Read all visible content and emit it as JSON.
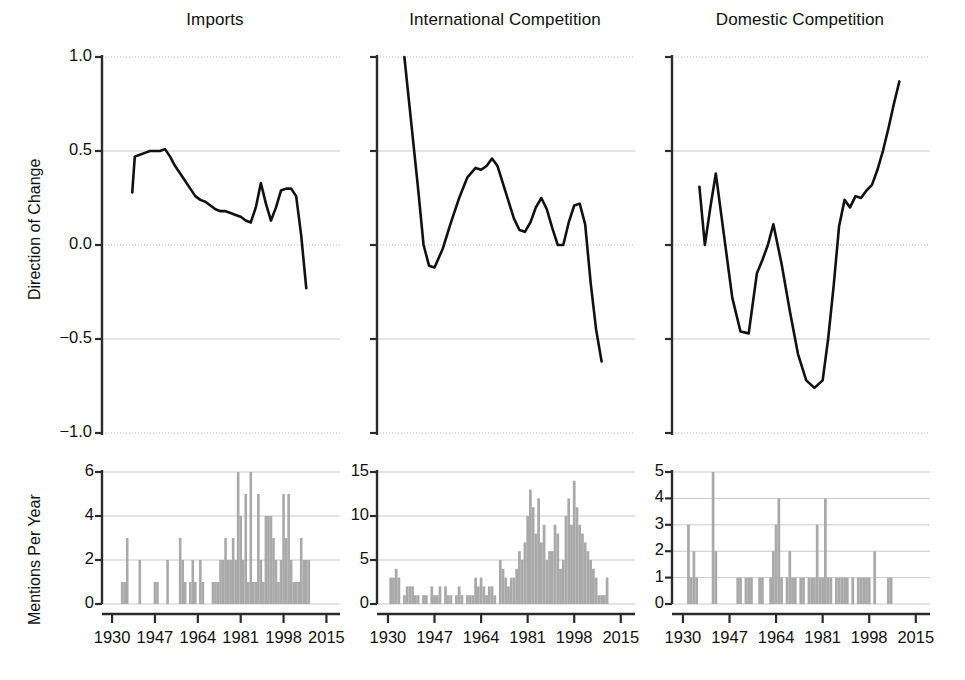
{
  "figure": {
    "width": 965,
    "height": 680,
    "background": "#ffffff",
    "line_color": "#111111",
    "bar_color": "#a9a9a9",
    "grid_color": "#c9c9c9"
  },
  "axis_titles": {
    "top_y": "Direction of Change",
    "bottom_y": "Mentions Per Year"
  },
  "panels": [
    {
      "key": "imports",
      "title": "Imports"
    },
    {
      "key": "international",
      "title": "International Competition"
    },
    {
      "key": "domestic",
      "title": "Domestic Competition"
    }
  ],
  "x_ticks": [
    "1930",
    "1947",
    "1964",
    "1981",
    "1998",
    "2015"
  ],
  "x_tick_values": [
    1930,
    1947,
    1964,
    1981,
    1998,
    2015
  ],
  "x_range": [
    1926,
    2018
  ],
  "y_ticks_top": [
    "1.0",
    "0.5",
    "0.0",
    "-0.5",
    "-1.0"
  ],
  "y_tick_values_top": [
    1.0,
    0.5,
    0.0,
    -0.5,
    -1.0
  ],
  "y_ticks_bottom": {
    "imports": [
      "0",
      "2",
      "4",
      "6"
    ],
    "international": [
      "0",
      "5",
      "10",
      "15"
    ],
    "domestic": [
      "0",
      "1",
      "2",
      "3",
      "4",
      "5"
    ]
  },
  "chart_data": [
    {
      "id": "imports-direction",
      "type": "line",
      "title": "Imports",
      "xlabel": "",
      "ylabel": "Direction of Change",
      "xlim": [
        1926,
        2018
      ],
      "ylim": [
        -1.0,
        1.0
      ],
      "grid": true,
      "legend": "none",
      "x": [
        1938,
        1939,
        1941,
        1943,
        1945,
        1947,
        1949,
        1951,
        1953,
        1955,
        1957,
        1959,
        1961,
        1963,
        1965,
        1967,
        1969,
        1971,
        1973,
        1975,
        1977,
        1979,
        1981,
        1983,
        1985,
        1987,
        1989,
        1991,
        1993,
        1995,
        1997,
        1999,
        2001,
        2003,
        2005,
        2007
      ],
      "y": [
        0.28,
        0.47,
        0.48,
        0.49,
        0.5,
        0.5,
        0.5,
        0.51,
        0.47,
        0.42,
        0.38,
        0.34,
        0.3,
        0.26,
        0.24,
        0.23,
        0.21,
        0.19,
        0.18,
        0.18,
        0.17,
        0.16,
        0.15,
        0.13,
        0.12,
        0.2,
        0.33,
        0.22,
        0.13,
        0.2,
        0.29,
        0.3,
        0.3,
        0.26,
        0.05,
        -0.23
      ]
    },
    {
      "id": "imports-mentions",
      "type": "bar",
      "title": "Imports",
      "xlabel": "",
      "ylabel": "Mentions Per Year",
      "xlim": [
        1926,
        2018
      ],
      "ylim": [
        0,
        6
      ],
      "grid": true,
      "legend": "none",
      "categories": [
        1934,
        1935,
        1936,
        1941,
        1947,
        1948,
        1952,
        1957,
        1958,
        1959,
        1961,
        1962,
        1963,
        1965,
        1966,
        1970,
        1971,
        1972,
        1973,
        1974,
        1975,
        1976,
        1977,
        1978,
        1979,
        1980,
        1981,
        1982,
        1983,
        1984,
        1985,
        1986,
        1987,
        1988,
        1989,
        1990,
        1991,
        1992,
        1993,
        1994,
        1995,
        1996,
        1997,
        1998,
        1999,
        2000,
        2001,
        2002,
        2003,
        2004,
        2005,
        2006,
        2007,
        2008
      ],
      "values": [
        1,
        1,
        3,
        2,
        1,
        1,
        2,
        3,
        2,
        1,
        1,
        2,
        1,
        2,
        1,
        1,
        1,
        1,
        2,
        2,
        3,
        2,
        2,
        3,
        2,
        6,
        4,
        2,
        5,
        1,
        6,
        1,
        1,
        5,
        2,
        1,
        4,
        4,
        4,
        3,
        2,
        1,
        2,
        5,
        3,
        5,
        2,
        1,
        1,
        1,
        3,
        2,
        2,
        2
      ]
    },
    {
      "id": "international-direction",
      "type": "line",
      "title": "International Competition",
      "xlabel": "",
      "ylabel": "Direction of Change",
      "xlim": [
        1926,
        2018
      ],
      "ylim": [
        -1.0,
        1.0
      ],
      "grid": true,
      "legend": "none",
      "x": [
        1936,
        1938,
        1941,
        1943,
        1945,
        1947,
        1950,
        1953,
        1956,
        1959,
        1962,
        1964,
        1966,
        1968,
        1970,
        1973,
        1976,
        1978,
        1980,
        1982,
        1984,
        1986,
        1988,
        1990,
        1992,
        1994,
        1996,
        1998,
        2000,
        2002,
        2004,
        2006,
        2008
      ],
      "y": [
        1.0,
        0.72,
        0.3,
        0.0,
        -0.11,
        -0.12,
        -0.02,
        0.12,
        0.25,
        0.36,
        0.41,
        0.4,
        0.42,
        0.46,
        0.42,
        0.28,
        0.14,
        0.08,
        0.07,
        0.12,
        0.2,
        0.25,
        0.19,
        0.09,
        0.0,
        0.0,
        0.12,
        0.21,
        0.22,
        0.11,
        -0.2,
        -0.45,
        -0.62
      ]
    },
    {
      "id": "international-mentions",
      "type": "bar",
      "title": "International Competition",
      "xlabel": "",
      "ylabel": "Mentions Per Year",
      "xlim": [
        1926,
        2018
      ],
      "ylim": [
        0,
        15
      ],
      "grid": true,
      "legend": "none",
      "categories": [
        1931,
        1932,
        1933,
        1934,
        1936,
        1937,
        1938,
        1939,
        1940,
        1941,
        1943,
        1944,
        1946,
        1947,
        1948,
        1949,
        1951,
        1952,
        1953,
        1955,
        1956,
        1957,
        1959,
        1960,
        1961,
        1962,
        1963,
        1964,
        1965,
        1966,
        1967,
        1968,
        1969,
        1971,
        1972,
        1973,
        1974,
        1975,
        1976,
        1977,
        1978,
        1979,
        1980,
        1981,
        1982,
        1983,
        1984,
        1985,
        1986,
        1987,
        1988,
        1989,
        1990,
        1991,
        1992,
        1993,
        1994,
        1995,
        1996,
        1997,
        1998,
        1999,
        2000,
        2001,
        2002,
        2003,
        2004,
        2005,
        2006,
        2007,
        2008,
        2009,
        2010
      ],
      "values": [
        3,
        3,
        4,
        3,
        1,
        2,
        2,
        2,
        1,
        1,
        1,
        1,
        2,
        1,
        1,
        2,
        2,
        1,
        1,
        1,
        2,
        1,
        1,
        1,
        1,
        3,
        2,
        3,
        2,
        1,
        2,
        2,
        1,
        5,
        4,
        3,
        2,
        3,
        3,
        4,
        6,
        5,
        7,
        10,
        13,
        11,
        8,
        12,
        7,
        9,
        5,
        6,
        6,
        9,
        8,
        4,
        5,
        10,
        12,
        9,
        14,
        11,
        9,
        8,
        7,
        6,
        5,
        4,
        3,
        1,
        1,
        1,
        3
      ]
    },
    {
      "id": "domestic-direction",
      "type": "line",
      "title": "Domestic Competition",
      "xlabel": "",
      "ylabel": "Direction of Change",
      "xlim": [
        1926,
        2018
      ],
      "ylim": [
        -1.0,
        1.0
      ],
      "grid": true,
      "legend": "none",
      "x": [
        1936,
        1938,
        1940,
        1942,
        1945,
        1948,
        1951,
        1954,
        1957,
        1959,
        1961,
        1963,
        1966,
        1969,
        1972,
        1975,
        1978,
        1981,
        1983,
        1985,
        1987,
        1989,
        1991,
        1993,
        1995,
        1997,
        1999,
        2001,
        2003,
        2005,
        2007,
        2009
      ],
      "y": [
        0.31,
        0.0,
        0.2,
        0.38,
        0.05,
        -0.28,
        -0.46,
        -0.47,
        -0.15,
        -0.08,
        0.0,
        0.11,
        -0.1,
        -0.35,
        -0.58,
        -0.72,
        -0.76,
        -0.72,
        -0.5,
        -0.22,
        0.1,
        0.24,
        0.2,
        0.26,
        0.25,
        0.29,
        0.32,
        0.4,
        0.5,
        0.62,
        0.75,
        0.87
      ]
    },
    {
      "id": "domestic-mentions",
      "type": "bar",
      "title": "Domestic Competition",
      "xlabel": "",
      "ylabel": "Mentions Per Year",
      "xlim": [
        1926,
        2018
      ],
      "ylim": [
        0,
        5
      ],
      "grid": true,
      "legend": "none",
      "categories": [
        1932,
        1933,
        1934,
        1935,
        1941,
        1942,
        1950,
        1951,
        1953,
        1954,
        1955,
        1958,
        1959,
        1962,
        1963,
        1964,
        1965,
        1966,
        1968,
        1969,
        1970,
        1971,
        1973,
        1974,
        1976,
        1977,
        1978,
        1979,
        1980,
        1981,
        1982,
        1983,
        1984,
        1986,
        1987,
        1988,
        1989,
        1990,
        1992,
        1994,
        1995,
        1996,
        1997,
        1998,
        2000,
        2005,
        2006
      ],
      "values": [
        3,
        1,
        2,
        1,
        5,
        2,
        1,
        1,
        1,
        1,
        1,
        1,
        1,
        1,
        2,
        3,
        4,
        1,
        1,
        2,
        1,
        1,
        1,
        1,
        1,
        1,
        1,
        3,
        1,
        1,
        4,
        1,
        1,
        1,
        1,
        1,
        1,
        1,
        1,
        1,
        1,
        1,
        1,
        1,
        2,
        1,
        1
      ]
    }
  ]
}
